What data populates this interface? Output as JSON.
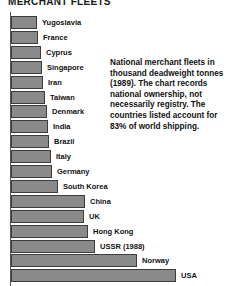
{
  "title": "MERCHANT FLEETS",
  "caption": "National merchant fleets in thousand deadweight tonnes (1989). The chart records national ownership, not necessarily registry. The countries listed account for 83% of world shipping.",
  "colors": {
    "bar_fill": "#8a8a8a",
    "bar_outline": "#3d3d3d",
    "text": "#111111",
    "axis": "#555555",
    "background": "#ffffff"
  },
  "chart_data": {
    "type": "bar",
    "orientation": "horizontal",
    "title": "MERCHANT FLEETS",
    "xlabel": "thousand deadweight tonnes",
    "ylabel": "",
    "grid": false,
    "legend": false,
    "note": "Bar lengths read off pixel extents; axis is unlabeled in the figure, values are relative lengths in pixels from the axis.",
    "categories": [
      "Yugoslavia",
      "France",
      "Cyprus",
      "Singapore",
      "Iran",
      "Taiwan",
      "Denmark",
      "India",
      "Brazil",
      "Italy",
      "Germany",
      "South Korea",
      "China",
      "UK",
      "Hong Kong",
      "USSR (1988)",
      "Norway",
      "USA"
    ],
    "values": [
      26,
      27,
      30,
      31,
      32,
      34,
      36,
      37,
      38,
      40,
      41,
      47,
      74,
      73,
      77,
      84,
      126,
      165
    ]
  }
}
